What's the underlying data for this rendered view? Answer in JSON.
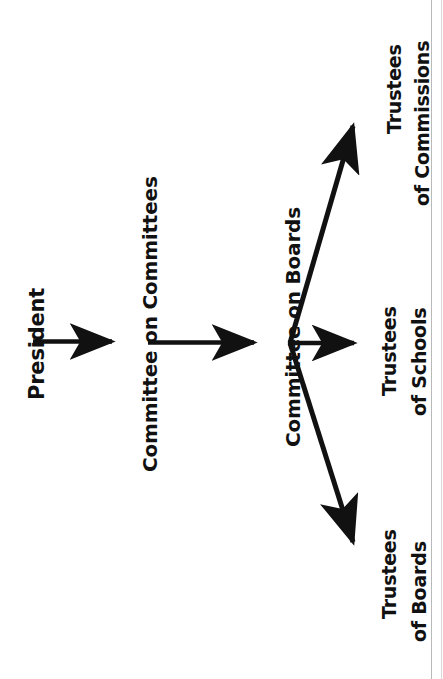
{
  "diagram": {
    "orientation": "rotated-90-ccw",
    "ink_color": "#111111",
    "background_color": "#ffffff",
    "nodes": [
      {
        "id": "president",
        "label": "President"
      },
      {
        "id": "committee-on-committees",
        "label": "Committee on Committees"
      },
      {
        "id": "committee-on-boards",
        "label": "Committee on Boards"
      },
      {
        "id": "trustees-of-commissions",
        "label_line1": "Trustees",
        "label_line2": "of Commissions"
      },
      {
        "id": "trustees-of-schools",
        "label_line1": "Trustees",
        "label_line2": "of Schools"
      },
      {
        "id": "trustees-of-boards",
        "label_line1": "Trustees",
        "label_line2": "of Boards"
      }
    ],
    "edges": [
      {
        "from": "president",
        "to": "committee-on-committees",
        "style": "straight-arrow"
      },
      {
        "from": "committee-on-committees",
        "to": "committee-on-boards",
        "style": "straight-arrow"
      },
      {
        "from": "committee-on-boards",
        "to": "trustees-of-commissions",
        "style": "diagonal-arrow"
      },
      {
        "from": "committee-on-boards",
        "to": "trustees-of-schools",
        "style": "straight-arrow"
      },
      {
        "from": "committee-on-boards",
        "to": "trustees-of-boards",
        "style": "diagonal-arrow"
      }
    ]
  }
}
